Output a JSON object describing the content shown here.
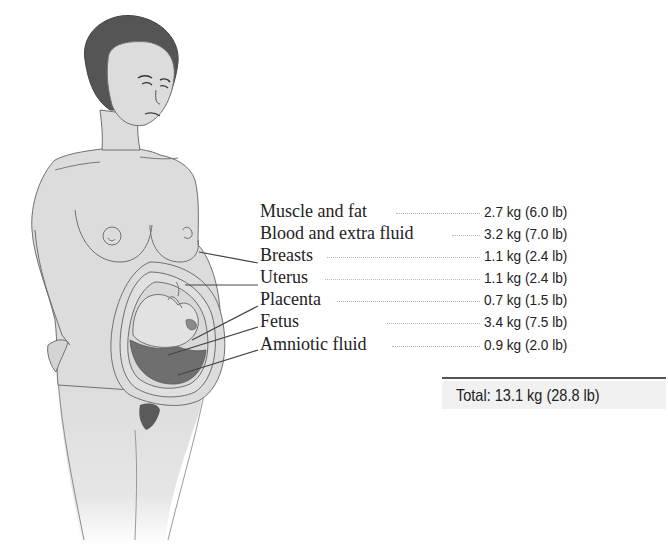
{
  "diagram": {
    "rows": [
      {
        "label": "Muscle and fat",
        "kg": "2.7 kg",
        "lb": "(6.0 lb)",
        "value": "2.7 kg  (6.0 lb)"
      },
      {
        "label": "Blood and extra fluid",
        "kg": "3.2 kg",
        "lb": "(7.0 lb)",
        "value": "3.2 kg  (7.0 lb)"
      },
      {
        "label": "Breasts",
        "kg": "1.1 kg",
        "lb": "(2.4 lb)",
        "value": "1.1 kg  (2.4 lb)"
      },
      {
        "label": "Uterus",
        "kg": "1.1 kg",
        "lb": "(2.4 lb)",
        "value": "1.1 kg  (2.4 lb)"
      },
      {
        "label": "Placenta",
        "kg": "0.7 kg",
        "lb": "(1.5 lb)",
        "value": "0.7 kg  (1.5 lb)"
      },
      {
        "label": "Fetus",
        "kg": "3.4 kg",
        "lb": "(7.5 lb)",
        "value": "3.4 kg  (7.5 lb)"
      },
      {
        "label": "Amniotic fluid",
        "kg": "0.9 kg",
        "lb": "(2.0 lb)",
        "value": "0.9 kg  (2.0 lb)"
      }
    ],
    "total": {
      "text": "Total: 13.1 kg (28.8 lb)",
      "kg": "13.1 kg",
      "lb": "(28.8 lb)"
    },
    "colors": {
      "skin": "#dcdcdc",
      "outline": "#6e6e6e",
      "hair": "#555555",
      "amniotic_dark": "#6f6f6f",
      "text": "#222222",
      "total_bg": "#f1f1f1"
    }
  }
}
